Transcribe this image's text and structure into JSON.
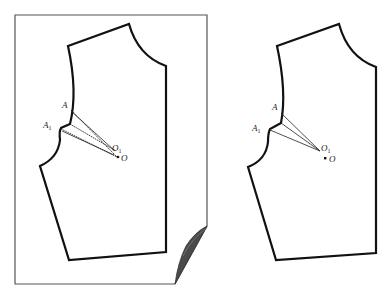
{
  "figure": {
    "panels": [
      {
        "id": "left",
        "background": "folded-paper-sheet",
        "dart_style": "dashed",
        "points": {
          "A": {
            "label": "A"
          },
          "A1": {
            "label": "A",
            "subscript": "1"
          },
          "O1": {
            "label": "O",
            "subscript": "1"
          },
          "O": {
            "label": "O"
          }
        }
      },
      {
        "id": "right",
        "background": "none",
        "dart_style": "solid",
        "points": {
          "A": {
            "label": "A"
          },
          "A1": {
            "label": "A",
            "subscript": "1"
          },
          "O1": {
            "label": "O",
            "subscript": "1"
          },
          "O": {
            "label": "O"
          }
        }
      }
    ],
    "colors": {
      "outline": "#111111",
      "frame": "#555555",
      "page_curl": "#4a4a4a"
    }
  }
}
